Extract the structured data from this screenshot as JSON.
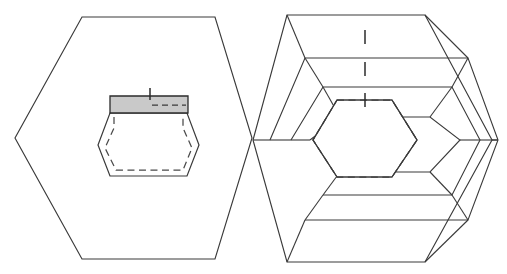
{
  "figure": {
    "width": 507,
    "height": 274,
    "background_color": "#ffffff",
    "line_color": "#3a3a3a",
    "shade_color": "#c9c9c9",
    "dash_color": "#4a4a4a"
  },
  "left_shape": {
    "name": "plain-hexagon",
    "kind": "hexagon",
    "center": [
      118,
      138
    ],
    "vertices": [
      [
        82,
        17
      ],
      [
        215,
        17
      ],
      [
        252,
        138
      ],
      [
        215,
        259
      ],
      [
        82,
        259
      ],
      [
        15,
        138
      ]
    ],
    "points": "82,17 215,17 252,138 215,259 82,259 15,138",
    "inner_cavity": {
      "name": "inner-cavity-hexagon",
      "points": "110,113 187,113 199,145 187,176 110,176 98,145",
      "shaded_face": {
        "name": "shaded-top-face",
        "points": "110,96 188,96 188,113 110,113",
        "fill": "#c9c9c9"
      },
      "dashed_outline": "114,128 183,128 192,148 183,170 116,170 105,148",
      "dashed_top_edge": "152,105 185,105",
      "tick": {
        "x": 150,
        "y1": 88,
        "y2": 100
      }
    }
  },
  "right_shape": {
    "name": "spiral-hexagon",
    "kind": "nested-hexagon-spiral",
    "center": [
      386,
      140
    ],
    "band_count": 4,
    "vertices": [
      [
        287,
        15
      ],
      [
        425,
        15
      ],
      [
        492,
        140
      ],
      [
        425,
        262
      ],
      [
        287,
        262
      ],
      [
        253,
        140
      ]
    ],
    "points": "287,15 425,15 492,140 425,262 287,262 253,140",
    "rings": [
      {
        "name": "ring-1",
        "points": "287,15 425,15 492,140 425,262 287,262 253,140"
      },
      {
        "name": "ring-2",
        "points": "305,58 468,58 498,140 468,220 305,220 270,140"
      },
      {
        "name": "ring-3",
        "points": "323,87 452,87 480,140 452,195 323,195 291,140"
      },
      {
        "name": "ring-4",
        "points": "340,117 430,117 460,140 430,172 340,172 310,140"
      }
    ],
    "dashed_inner_hexagon": {
      "name": "inner-dashed-hexagon",
      "points": "337,100 392,100 417,140 392,177 337,177 313,140"
    },
    "ticks": [
      {
        "name": "tick-top-1",
        "x": 365,
        "y1": 30,
        "y2": 44
      },
      {
        "name": "tick-top-2",
        "x": 365,
        "y1": 62,
        "y2": 76
      },
      {
        "name": "tick-top-3",
        "x": 365,
        "y1": 93,
        "y2": 107
      }
    ]
  },
  "legend": {
    "solid_line_meaning": "visible edge",
    "dashed_line_meaning": "hidden edge",
    "shaded_meaning": "sectioned face"
  }
}
